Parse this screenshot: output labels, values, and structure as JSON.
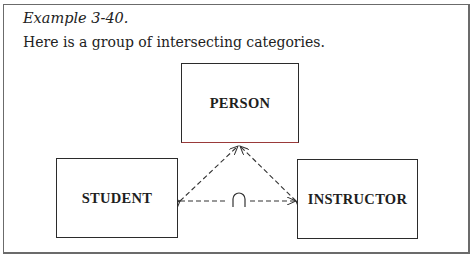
{
  "caption": "Example 3-40.",
  "intro": "Here is a group of intersecting categories.",
  "diagram": {
    "nodes": [
      {
        "id": "person",
        "label": "PERSON"
      },
      {
        "id": "student",
        "label": "STUDENT"
      },
      {
        "id": "instructor",
        "label": "INSTRUCTOR"
      }
    ],
    "edges": [
      {
        "from": "student",
        "to": "person",
        "style": "dashed",
        "arrow": "both"
      },
      {
        "from": "instructor",
        "to": "person",
        "style": "dashed",
        "arrow": "both"
      },
      {
        "from": "student",
        "to": "instructor",
        "style": "dashed",
        "arrow": "both",
        "symbol": "intersection"
      }
    ],
    "intersection_symbol": "∩"
  }
}
